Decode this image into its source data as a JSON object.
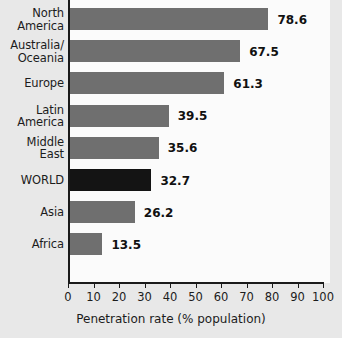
{
  "chart_data": {
    "type": "bar",
    "orientation": "horizontal",
    "title": "",
    "subtitle": "",
    "xlabel": "Penetration rate (% population)",
    "ylabel": "",
    "xlim": [
      0,
      100
    ],
    "xticks": [
      "0",
      "10",
      "20",
      "30",
      "40",
      "50",
      "60",
      "70",
      "80",
      "90",
      "100"
    ],
    "grid": false,
    "legend": null,
    "categories": [
      "North America",
      "Australia/ Oceania",
      "Europe",
      "Latin America",
      "Middle East",
      "WORLD",
      "Asia",
      "Africa"
    ],
    "values": [
      78.6,
      67.5,
      61.3,
      39.5,
      35.6,
      32.7,
      26.2,
      13.5
    ],
    "value_labels": [
      "78.6",
      "67.5",
      "61.3",
      "39.5",
      "35.6",
      "32.7",
      "26.2",
      "13.5"
    ],
    "bars": [
      {
        "label_line1": "North",
        "label_line2": "America",
        "value": 78.6,
        "value_label": "78.6",
        "highlight": false
      },
      {
        "label_line1": "Australia/",
        "label_line2": "Oceania",
        "value": 67.5,
        "value_label": "67.5",
        "highlight": false
      },
      {
        "label_line1": "Europe",
        "label_line2": "",
        "value": 61.3,
        "value_label": "61.3",
        "highlight": false
      },
      {
        "label_line1": "Latin",
        "label_line2": "America",
        "value": 39.5,
        "value_label": "39.5",
        "highlight": false
      },
      {
        "label_line1": "Middle",
        "label_line2": "East",
        "value": 35.6,
        "value_label": "35.6",
        "highlight": false
      },
      {
        "label_line1": "WORLD",
        "label_line2": "",
        "value": 32.7,
        "value_label": "32.7",
        "highlight": true
      },
      {
        "label_line1": "Asia",
        "label_line2": "",
        "value": 26.2,
        "value_label": "26.2",
        "highlight": false
      },
      {
        "label_line1": "Africa",
        "label_line2": "",
        "value": 13.5,
        "value_label": "13.5",
        "highlight": false
      }
    ],
    "colors": {
      "bar": "#6f6f6f",
      "bar_highlight": "#141414",
      "background": "#e8e8e8",
      "plot_background": "#fbfbfb",
      "axis": "#1a1a1a",
      "text": "#1c1c1c"
    }
  }
}
